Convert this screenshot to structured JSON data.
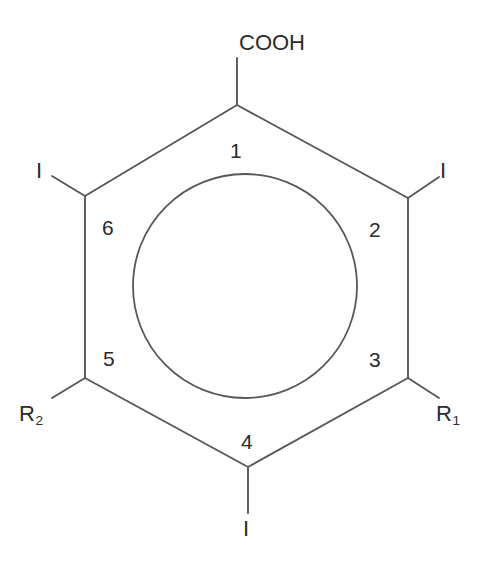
{
  "diagram": {
    "core": {
      "name": "benzene-ring",
      "aromatic_circle": true,
      "vertex_count": 6
    },
    "position_numbers": [
      {
        "id": "pos-1",
        "label": "1",
        "x": 230,
        "y": 140
      },
      {
        "id": "pos-2",
        "label": "2",
        "x": 369,
        "y": 219
      },
      {
        "id": "pos-3",
        "label": "3",
        "x": 369,
        "y": 349
      },
      {
        "id": "pos-4",
        "label": "4",
        "x": 241,
        "y": 431
      },
      {
        "id": "pos-5",
        "label": "5",
        "x": 103,
        "y": 348
      },
      {
        "id": "pos-6",
        "label": "6",
        "x": 102,
        "y": 217
      }
    ],
    "substituents": [
      {
        "id": "sub-1",
        "position": "1",
        "label": "COOH",
        "has_subscript": false,
        "x": 239,
        "y": 32
      },
      {
        "id": "sub-2",
        "position": "2",
        "label": "I",
        "has_subscript": false,
        "x": 440,
        "y": 160
      },
      {
        "id": "sub-3",
        "position": "3",
        "label": "R",
        "subscript": "1",
        "has_subscript": true,
        "x": 436,
        "y": 403
      },
      {
        "id": "sub-4",
        "position": "4",
        "label": "I",
        "has_subscript": false,
        "x": 243,
        "y": 518
      },
      {
        "id": "sub-5",
        "position": "5",
        "label": "R",
        "subscript": "2",
        "has_subscript": true,
        "x": 19,
        "y": 403
      },
      {
        "id": "sub-6",
        "position": "6",
        "label": "I",
        "has_subscript": false,
        "x": 36,
        "y": 160
      }
    ],
    "colors": {
      "bond": "#58585a",
      "text": "#2b2b2b",
      "background": "#ffffff"
    }
  }
}
